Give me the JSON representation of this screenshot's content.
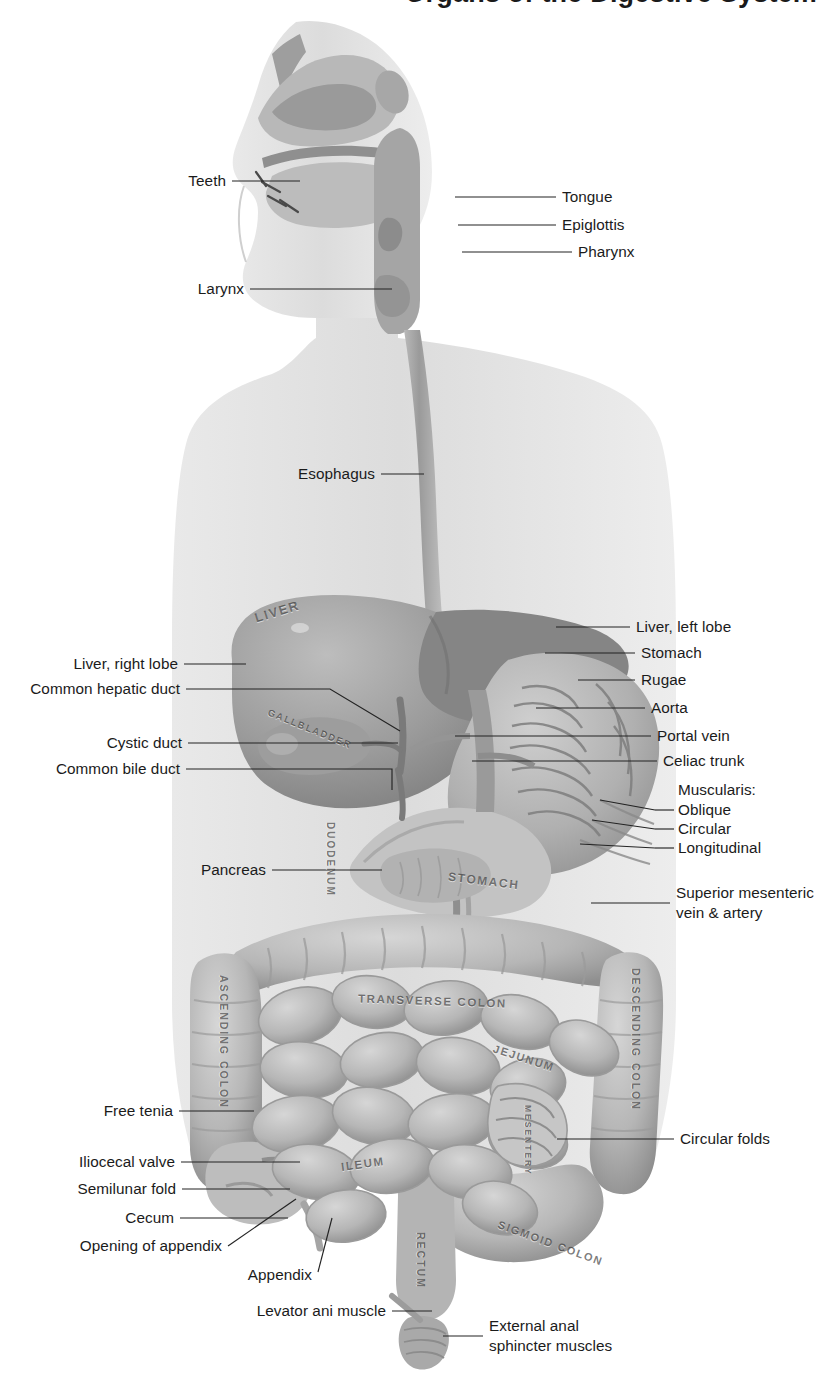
{
  "figure": {
    "title_partial": "Organs of the Digestive System",
    "type": "anatomical-illustration",
    "palette": {
      "background": "#ffffff",
      "body_silhouette": "#d8d8d8",
      "organ_mid": "#a9a9a9",
      "organ_dark": "#7d7d7d",
      "organ_light": "#c9c9c9",
      "leader_line": "#232323",
      "label_text": "#1b1b1b",
      "embossed_text": "#4a4a4a"
    }
  },
  "labels_left": [
    {
      "id": "teeth",
      "text": "Teeth",
      "x": 183,
      "y": 185,
      "line_x1": 232,
      "line_x2": 300,
      "line_y": 181,
      "tip_x": 300,
      "tip_y": 181
    },
    {
      "id": "larynx",
      "text": "Larynx",
      "x": 200,
      "y": 293,
      "line_x1": 250,
      "line_x2": 392,
      "line_y": 289,
      "tip_x": 392,
      "tip_y": 289
    },
    {
      "id": "esophagus",
      "text": "Esophagus",
      "x": 302,
      "y": 478,
      "line_x1": 381,
      "line_x2": 424,
      "line_y": 474,
      "tip_x": 424,
      "tip_y": 474
    },
    {
      "id": "liver-right-lobe",
      "text": "Liver, right lobe",
      "x": 66,
      "y": 668,
      "line_x1": 184,
      "line_x2": 246,
      "line_y": 664,
      "tip_x": 246,
      "tip_y": 664
    },
    {
      "id": "common-hepatic-duct",
      "text": "Common hepatic duct",
      "x": 24,
      "y": 693,
      "line_x1": 186,
      "line_x2": 395,
      "line_y": 689,
      "tip_x": 395,
      "tip_y": 689
    },
    {
      "id": "cystic-duct",
      "text": "Cystic duct",
      "x": 108,
      "y": 747,
      "line_x1": 188,
      "line_x2": 398,
      "line_y": 743,
      "tip_x": 398,
      "tip_y": 743
    },
    {
      "id": "common-bile-duct",
      "text": "Common bile duct",
      "x": 52,
      "y": 773,
      "line_x1": 186,
      "line_x2": 392,
      "line_y": 769,
      "tip_x": 392,
      "tip_y": 769
    },
    {
      "id": "pancreas",
      "text": "Pancreas",
      "x": 205,
      "y": 874,
      "line_x1": 272,
      "line_x2": 382,
      "line_y": 870,
      "tip_x": 382,
      "tip_y": 870
    },
    {
      "id": "free-tenia",
      "text": "Free tenia",
      "x": 110,
      "y": 1115,
      "line_x1": 179,
      "line_x2": 254,
      "line_y": 1111,
      "tip_x": 254,
      "tip_y": 1111
    },
    {
      "id": "iliocecal-valve",
      "text": "Iliocecal valve",
      "x": 85,
      "y": 1166,
      "line_x1": 181,
      "line_x2": 300,
      "line_y": 1162,
      "tip_x": 300,
      "tip_y": 1162
    },
    {
      "id": "semilunar-fold",
      "text": "Semilunar fold",
      "x": 81,
      "y": 1193,
      "line_x1": 182,
      "line_x2": 290,
      "line_y": 1189,
      "tip_x": 290,
      "tip_y": 1189
    },
    {
      "id": "cecum",
      "text": "Cecum",
      "x": 127,
      "y": 1222,
      "line_x1": 180,
      "line_x2": 288,
      "line_y": 1218,
      "tip_x": 288,
      "tip_y": 1218
    },
    {
      "id": "opening-of-appendix",
      "text": "Opening of appendix",
      "x": 70,
      "y": 1250,
      "line_x1": 228,
      "line_x2": 296,
      "line_y": 1246,
      "tip_x": 296,
      "tip_y": 1199
    },
    {
      "id": "appendix",
      "text": "Appendix",
      "x": 262,
      "y": 1279,
      "line_x1": 318,
      "line_x2": 330,
      "line_y": 1272,
      "tip_x": 330,
      "tip_y": 1220
    },
    {
      "id": "levator-ani-muscle",
      "text": "Levator ani muscle",
      "x": 252,
      "y": 1315,
      "line_x1": 392,
      "line_x2": 432,
      "line_y": 1311,
      "tip_x": 432,
      "tip_y": 1311
    }
  ],
  "labels_right": [
    {
      "id": "tongue",
      "text": "Tongue",
      "x": 562,
      "y": 201,
      "line_x1": 455,
      "line_x2": 556,
      "line_y": 197
    },
    {
      "id": "epiglottis",
      "text": "Epiglottis",
      "x": 562,
      "y": 229,
      "line_x1": 458,
      "line_x2": 556,
      "line_y": 225
    },
    {
      "id": "pharynx",
      "text": "Pharynx",
      "x": 578,
      "y": 256,
      "line_x1": 462,
      "line_x2": 572,
      "line_y": 252
    },
    {
      "id": "liver-left-lobe",
      "text": "Liver, left lobe",
      "x": 636,
      "y": 631,
      "line_x1": 556,
      "line_x2": 630,
      "line_y": 627
    },
    {
      "id": "stomach",
      "text": "Stomach",
      "x": 641,
      "y": 657,
      "line_x1": 545,
      "line_x2": 635,
      "line_y": 653
    },
    {
      "id": "rugae",
      "text": "Rugae",
      "x": 641,
      "y": 684,
      "line_x1": 578,
      "line_x2": 635,
      "line_y": 680
    },
    {
      "id": "aorta",
      "text": "Aorta",
      "x": 651,
      "y": 712,
      "line_x1": 536,
      "line_x2": 645,
      "line_y": 708
    },
    {
      "id": "portal-vein",
      "text": "Portal vein",
      "x": 657,
      "y": 740,
      "line_x1": 455,
      "line_x2": 651,
      "line_y": 736
    },
    {
      "id": "celiac-trunk",
      "text": "Celiac trunk",
      "x": 663,
      "y": 765,
      "line_x1": 472,
      "line_x2": 657,
      "line_y": 761
    },
    {
      "id": "muscularis-heading",
      "text": "Muscularis:",
      "x": 678,
      "y": 794
    },
    {
      "id": "oblique",
      "text": "Oblique",
      "x": 678,
      "y": 814,
      "line_x1": 655,
      "line_x2": 674,
      "line_y": 810
    },
    {
      "id": "circular",
      "text": "Circular",
      "x": 678,
      "y": 833,
      "line_x1": 655,
      "line_x2": 674,
      "line_y": 829
    },
    {
      "id": "longitudinal",
      "text": "Longitudinal",
      "x": 678,
      "y": 852,
      "line_x1": 655,
      "line_x2": 674,
      "line_y": 848
    },
    {
      "id": "circular-folds",
      "text": "Circular folds",
      "x": 680,
      "y": 1143,
      "line_x1": 557,
      "line_x2": 674,
      "line_y": 1139
    }
  ],
  "labels_multiline": [
    {
      "id": "superior-mesenteric",
      "lines": [
        "Superior mesenteric",
        "vein & artery"
      ],
      "x": 676,
      "y": 897,
      "line_x1": 591,
      "line_x2": 670,
      "line_y": 903
    },
    {
      "id": "external-anal-sphincter",
      "lines": [
        "External anal",
        "sphincter muscles"
      ],
      "x": 489,
      "y": 1330,
      "line_x1": 443,
      "line_x2": 483,
      "line_y": 1336
    }
  ],
  "embossed_labels": [
    {
      "id": "liver",
      "text": "LIVER",
      "x": 254,
      "y": 604,
      "rotate": -17,
      "size": 13
    },
    {
      "id": "gallbladder",
      "text": "GALLBLADDER",
      "x": 265,
      "y": 723,
      "rotate": 22,
      "size": 9.5
    },
    {
      "id": "duodenum",
      "text": "DUODENUM",
      "x": 325,
      "y": 822,
      "vertical": "down",
      "size": 10
    },
    {
      "id": "stomach",
      "text": "STOMACH",
      "x": 448,
      "y": 874,
      "rotate": 7,
      "size": 12
    },
    {
      "id": "ascending-colon",
      "text": "ASCENDING COLON",
      "x": 218,
      "y": 975,
      "vertical": "down",
      "size": 10.5
    },
    {
      "id": "transverse-colon",
      "text": "TRANSVERSE COLON",
      "x": 358,
      "y": 995,
      "rotate": 2,
      "size": 11.5
    },
    {
      "id": "descending-colon",
      "text": "DESCENDING COLON",
      "x": 630,
      "y": 968,
      "vertical": "down",
      "size": 10.5
    },
    {
      "id": "jejunum",
      "text": "JEJUNUM",
      "x": 492,
      "y": 1052,
      "rotate": 18,
      "size": 11
    },
    {
      "id": "mesentery",
      "text": "MESENTERY",
      "x": 523,
      "y": 1105,
      "vertical": "down",
      "size": 8.5
    },
    {
      "id": "ileum",
      "text": "ILEUM",
      "x": 341,
      "y": 1158,
      "rotate": -8,
      "size": 11.5
    },
    {
      "id": "rectum",
      "text": "RECTUM",
      "x": 415,
      "y": 1232,
      "vertical": "down",
      "size": 10.5
    },
    {
      "id": "sigmoid-colon",
      "text": "SIGMOID COLON",
      "x": 495,
      "y": 1237,
      "rotate": 20,
      "size": 11
    }
  ]
}
